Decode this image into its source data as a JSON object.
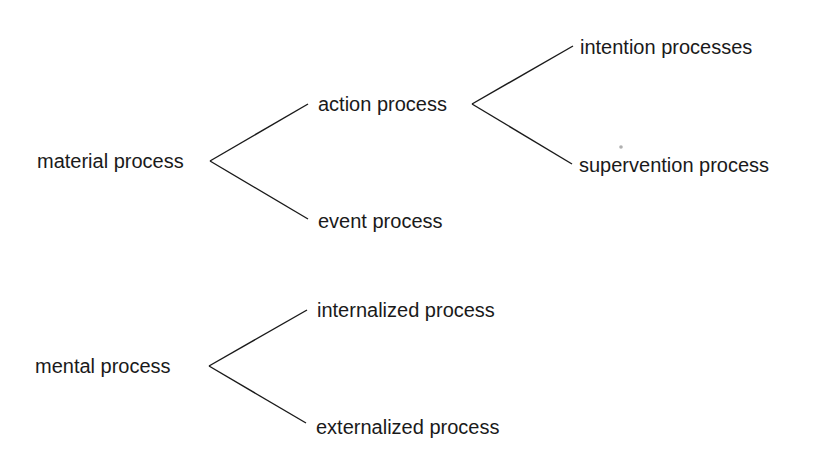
{
  "diagram": {
    "type": "branching-tree",
    "trees": [
      {
        "root": "material process",
        "children": [
          {
            "label": "action process",
            "children": [
              {
                "label": "intention processes"
              },
              {
                "label": "supervention process"
              }
            ]
          },
          {
            "label": "event process"
          }
        ]
      },
      {
        "root": "mental process",
        "children": [
          {
            "label": "internalized process"
          },
          {
            "label": "externalized process"
          }
        ]
      }
    ]
  },
  "labels": {
    "material": "material process",
    "action": "action process",
    "intention": "intention processes",
    "supervention": "supervention process",
    "event": "event process",
    "mental": "mental process",
    "internalized": "internalized process",
    "externalized": "externalized process"
  },
  "colors": {
    "ink": "#1a1a1a",
    "background": "#ffffff"
  }
}
